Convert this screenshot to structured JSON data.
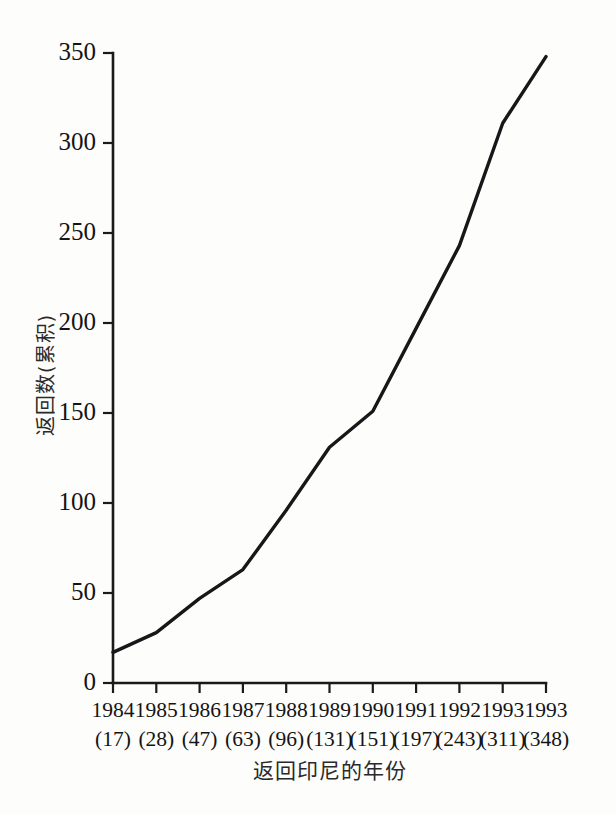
{
  "chart_data": {
    "type": "line",
    "title": "",
    "xlabel": "返回印尼的年份",
    "ylabel": "返回数(累积)",
    "categories": [
      "1984",
      "1985",
      "1986",
      "1987",
      "1988",
      "1989",
      "1990",
      "1991",
      "1992",
      "1993",
      "1993"
    ],
    "values": [
      17,
      28,
      47,
      63,
      96,
      131,
      151,
      197,
      243,
      311,
      348
    ],
    "point_labels": [
      "(17)",
      "(28)",
      "(47)",
      "(63)",
      "(96)",
      "(131)",
      "(151)",
      "(197)",
      "(243)",
      "(311)",
      "(348)"
    ],
    "ylim": [
      0,
      350
    ],
    "ytick_labels": [
      "0",
      "50",
      "100",
      "150",
      "200",
      "250",
      "300",
      "350"
    ],
    "ytick_values": [
      0,
      50,
      100,
      150,
      200,
      250,
      300,
      350
    ],
    "grid": false,
    "legend": false,
    "legend_position": "none",
    "line_color": "#17171a",
    "background_color": "#fdfdfc"
  }
}
